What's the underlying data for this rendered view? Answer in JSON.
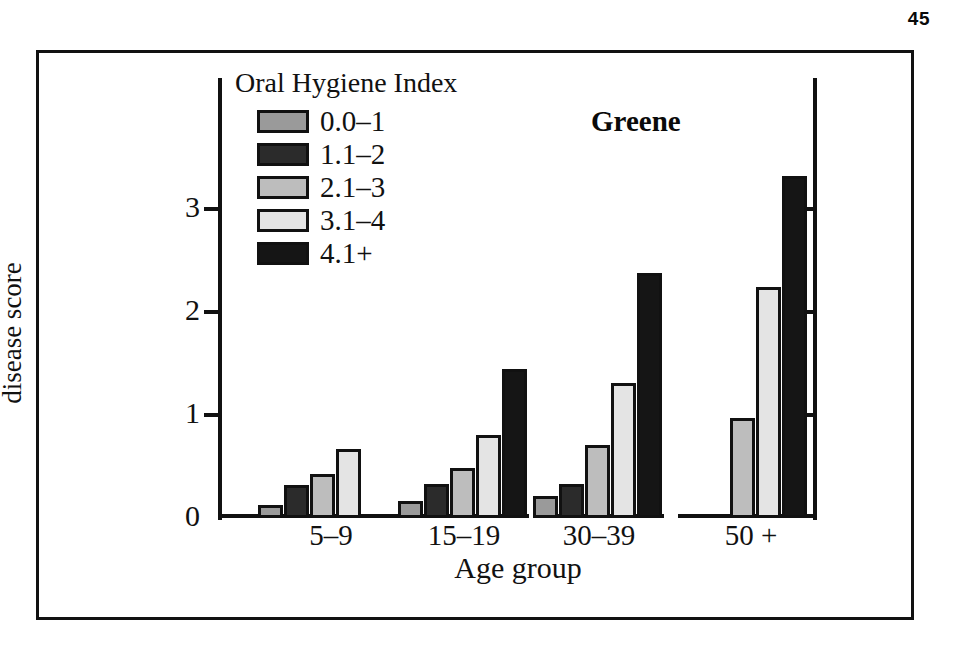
{
  "page_number": "45",
  "series_label": "Greene",
  "legend": {
    "title": "Oral Hygiene Index",
    "items": [
      {
        "label": "0.0–1",
        "color": "#9a9a9a"
      },
      {
        "label": "1.1–2",
        "color": "#2b2b2b"
      },
      {
        "label": "2.1–3",
        "color": "#bdbdbd"
      },
      {
        "label": "3.1–4",
        "color": "#e4e4e4"
      },
      {
        "label": "4.1+",
        "color": "#151515"
      }
    ]
  },
  "axes": {
    "x_title": "Age group",
    "y_title_line1": "Mean periodontal",
    "y_title_line2": "disease score",
    "y_ticks": [
      "0",
      "1",
      "2",
      "3"
    ],
    "right_axis_ticks": [
      "1",
      "2",
      "3"
    ]
  },
  "chart_data": {
    "type": "bar",
    "title": "Greene",
    "xlabel": "Age group",
    "ylabel": "Mean periodontal disease score",
    "ylim": [
      0,
      3.6
    ],
    "yticks": [
      0,
      1,
      2,
      3
    ],
    "grid": false,
    "legend_title": "Oral Hygiene Index",
    "legend_position": "upper-left-inside",
    "categories": [
      "5–9",
      "15–19",
      "30–39",
      "50 +"
    ],
    "series": [
      {
        "name": "0.0–1",
        "color": "#9a9a9a",
        "values": [
          0.13,
          0.17,
          0.21,
          null
        ]
      },
      {
        "name": "1.1–2",
        "color": "#2b2b2b",
        "values": [
          0.32,
          0.33,
          0.33,
          null
        ]
      },
      {
        "name": "2.1–3",
        "color": "#bdbdbd",
        "values": [
          0.43,
          0.49,
          0.71,
          0.97
        ]
      },
      {
        "name": "3.1–4",
        "color": "#e4e4e4",
        "values": [
          0.67,
          0.81,
          1.31,
          2.24
        ]
      },
      {
        "name": "4.1+",
        "color": "#151515",
        "values": [
          null,
          1.45,
          2.38,
          3.32
        ]
      }
    ]
  }
}
